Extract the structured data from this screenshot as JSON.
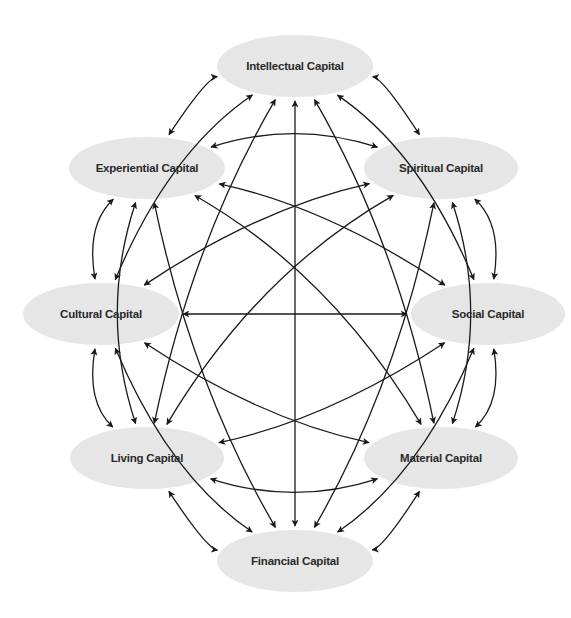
{
  "diagram": {
    "type": "complete-graph",
    "edge_style": "bidirectional-arrow",
    "colors": {
      "node_fill": "#e6e6e6",
      "edge": "#1a1a1a",
      "label": "#2a2a2a",
      "background": "#ffffff"
    },
    "nodes": [
      {
        "id": "intellectual",
        "label": "Intellectual Capital"
      },
      {
        "id": "spiritual",
        "label": "Spiritual Capital"
      },
      {
        "id": "social",
        "label": "Social Capital"
      },
      {
        "id": "material",
        "label": "Material Capital"
      },
      {
        "id": "financial",
        "label": "Financial Capital"
      },
      {
        "id": "living",
        "label": "Living Capital"
      },
      {
        "id": "cultural",
        "label": "Cultural Capital"
      },
      {
        "id": "experiential",
        "label": "Experiential Capital"
      }
    ],
    "edges": [
      [
        "intellectual",
        "spiritual"
      ],
      [
        "intellectual",
        "social"
      ],
      [
        "intellectual",
        "material"
      ],
      [
        "intellectual",
        "financial"
      ],
      [
        "intellectual",
        "living"
      ],
      [
        "intellectual",
        "cultural"
      ],
      [
        "intellectual",
        "experiential"
      ],
      [
        "spiritual",
        "social"
      ],
      [
        "spiritual",
        "material"
      ],
      [
        "spiritual",
        "financial"
      ],
      [
        "spiritual",
        "living"
      ],
      [
        "spiritual",
        "cultural"
      ],
      [
        "spiritual",
        "experiential"
      ],
      [
        "social",
        "material"
      ],
      [
        "social",
        "financial"
      ],
      [
        "social",
        "living"
      ],
      [
        "social",
        "cultural"
      ],
      [
        "social",
        "experiential"
      ],
      [
        "material",
        "financial"
      ],
      [
        "material",
        "living"
      ],
      [
        "material",
        "cultural"
      ],
      [
        "material",
        "experiential"
      ],
      [
        "financial",
        "living"
      ],
      [
        "financial",
        "cultural"
      ],
      [
        "financial",
        "experiential"
      ],
      [
        "living",
        "cultural"
      ],
      [
        "living",
        "experiential"
      ],
      [
        "cultural",
        "experiential"
      ]
    ]
  }
}
